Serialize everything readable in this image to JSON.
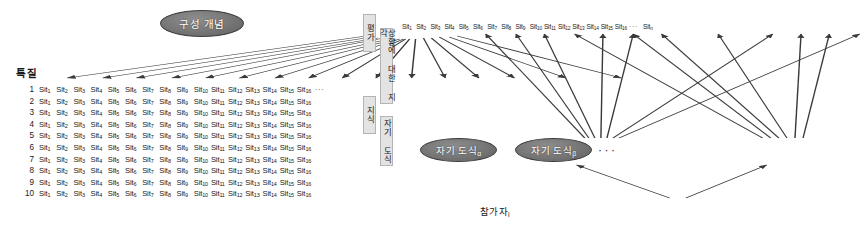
{
  "figure": {
    "left": {
      "construct_node": "구성 개념",
      "trait_label": "특질",
      "row_numbers": [
        "1",
        "2",
        "3",
        "4",
        "5",
        "6",
        "7",
        "8",
        "9",
        "10"
      ],
      "cell_base": "Sit",
      "cell_subscripts": [
        "1",
        "2",
        "3",
        "4",
        "5",
        "6",
        "7",
        "8",
        "9",
        "10",
        "11",
        "12",
        "13",
        "14",
        "15",
        "16"
      ],
      "row_ellipsis": "···",
      "n_rows": 10,
      "n_cols": 16,
      "arrow_count": 16,
      "arrow_color": "#3a3a3a"
    },
    "right": {
      "vertical_labels": {
        "evaluation": "평가",
        "knowledge": "지식",
        "perception": "상황에 대한 지각",
        "self_schema": "자기 도식"
      },
      "sit_base": "Sit",
      "sit_subscripts": [
        "1",
        "2",
        "3",
        "4",
        "5",
        "6",
        "7",
        "8",
        "9",
        "10",
        "11",
        "12",
        "13",
        "14",
        "15",
        "16"
      ],
      "sit_ellipsis": "···",
      "sit_last": "Sit",
      "sit_last_sub": "n",
      "schema_nodes": [
        {
          "label": "자기 도식",
          "subscript": "α"
        },
        {
          "label": "자기 도식",
          "subscript": "β"
        }
      ],
      "schema_ellipsis": "···",
      "participant_label": "참가자",
      "participant_subscript": "i"
    },
    "colors": {
      "node_fill": "#6f6f6f",
      "node_text": "#ffffff",
      "arrow": "#3a3a3a",
      "label_bg": "#e3e3e3",
      "background": "#ffffff"
    }
  }
}
